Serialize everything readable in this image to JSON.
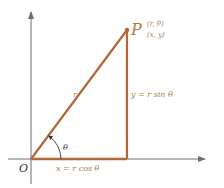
{
  "diagram": {
    "colors": {
      "axes": "#6e6e6e",
      "triangle": "#b4653a",
      "labels": "#b07a48",
      "origin_label": "#333333"
    },
    "labels": {
      "origin": "O",
      "point": "P",
      "polar_coords": "(r, θ)",
      "cartesian_coords": "(x, y)",
      "hypotenuse": "r",
      "angle": "θ",
      "horizontal_leg": "x = r cos θ",
      "vertical_leg": "y = r sin θ"
    }
  }
}
